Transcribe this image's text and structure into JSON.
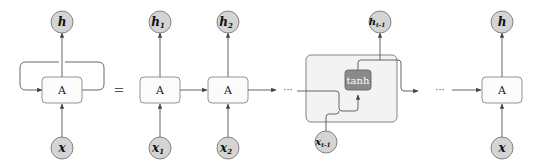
{
  "diagram": {
    "equals_sign": "=",
    "ellipsis": "···",
    "rolled": {
      "output": "h",
      "cell": "A",
      "input": "x"
    },
    "unrolled": [
      {
        "output": "h",
        "output_sub": "1",
        "cell": "A",
        "input": "x",
        "input_sub": "1"
      },
      {
        "output": "h",
        "output_sub": "2",
        "cell": "A",
        "input": "x",
        "input_sub": "2"
      },
      {
        "output": "h",
        "output_sub": "t-1",
        "cell": "tanh",
        "input": "x",
        "input_sub": "t-1",
        "expanded": true
      },
      {
        "output": "h",
        "output_sub": "",
        "cell": "A",
        "input": "x",
        "input_sub": ""
      }
    ],
    "colors": {
      "node_fill": "#d4d4d4",
      "node_stroke": "#777777",
      "box_fill": "#fbfbfb",
      "box_stroke": "#888888",
      "expanded_fill": "#f3f3f3",
      "tanh_fill": "#8a8a8a",
      "line": "#555555"
    }
  }
}
